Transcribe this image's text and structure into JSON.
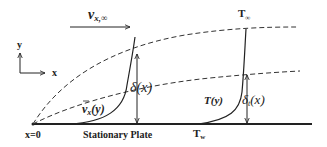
{
  "diagram": {
    "labels": {
      "free_stream_velocity": "v",
      "free_stream_velocity_sub": "x,∞",
      "free_stream_temperature": "T",
      "free_stream_temperature_sub": "∞",
      "axis_y": "y",
      "axis_x": "x",
      "origin": "x=0",
      "plate": "Stationary Plate",
      "wall_temperature": "T",
      "wall_temperature_sub": "w",
      "velocity_profile": "v",
      "velocity_profile_sub": "x",
      "velocity_profile_arg": "(y)",
      "velocity_bl_thickness": "δ(x)",
      "temperature_profile": "T(y)",
      "thermal_bl_thickness": "δ",
      "thermal_bl_thickness_sub": "t",
      "thermal_bl_thickness_arg": "(x)"
    },
    "colors": {
      "line": "#222222",
      "dashed": "#333333",
      "background": "#ffffff"
    }
  }
}
